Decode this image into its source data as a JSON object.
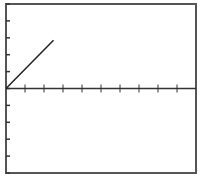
{
  "chart_data": {
    "type": "line",
    "title": "",
    "xlabel": "",
    "ylabel": "",
    "xlim": [
      0,
      10
    ],
    "ylim": [
      -5,
      5
    ],
    "x_ticks": [
      0,
      1,
      2,
      3,
      4,
      5,
      6,
      7,
      8,
      9,
      10
    ],
    "y_ticks": [
      -5,
      -4,
      -3,
      -2,
      -1,
      0,
      1,
      2,
      3,
      4,
      5
    ],
    "tick_labels_visible": false,
    "grid": false,
    "legend": null,
    "axis_line_at_y": 0,
    "series": [
      {
        "name": "line",
        "x": [
          0,
          2.5
        ],
        "y": [
          0,
          2.85
        ],
        "color": "#222222"
      }
    ]
  },
  "style": {
    "frame_color": "#555555",
    "axis_color": "#333333",
    "line_color": "#222222",
    "background": "#ffffff"
  },
  "layout": {
    "plot_left": 6,
    "plot_right": 196,
    "plot_top": 4,
    "plot_bottom": 173
  }
}
